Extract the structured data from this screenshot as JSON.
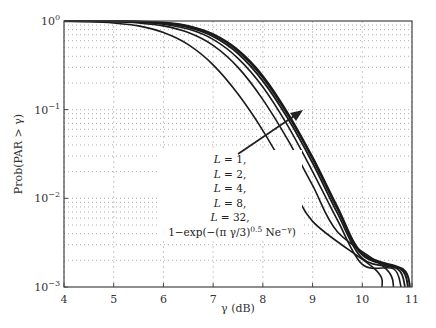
{
  "chart_data": {
    "type": "line",
    "title": "",
    "xlabel": "γ (dB)",
    "ylabel": "Prob(PAR > γ)",
    "xlim": [
      4,
      11
    ],
    "ylim": [
      0.001,
      1
    ],
    "yscale": "log",
    "grid": true,
    "x_ticks": [
      "4",
      "5",
      "6",
      "7",
      "8",
      "9",
      "10",
      "11"
    ],
    "y_ticks": [
      {
        "base": "10",
        "exp": "0"
      },
      {
        "base": "10",
        "exp": "−1"
      },
      {
        "base": "10",
        "exp": "−2"
      },
      {
        "base": "10",
        "exp": "−3"
      }
    ],
    "legend": [
      "L = 1,",
      "L = 2,",
      "L = 4,",
      "L = 8,",
      "L = 32,",
      "1−exp(−(π γ/3)^0.5 Ne^−γ)"
    ],
    "legend_position": "center-left (inside plot)",
    "annotation": "arrow pointing up-right indicating increasing L",
    "x": [
      4.0,
      4.5,
      5.0,
      5.5,
      6.0,
      6.5,
      7.0,
      7.5,
      8.0,
      8.5,
      9.0,
      9.5,
      10.0,
      10.5,
      11.0
    ],
    "series": [
      {
        "name": "L = 1",
        "values": [
          0.99,
          0.98,
          0.95,
          0.88,
          0.74,
          0.54,
          0.32,
          0.15,
          0.058,
          0.019,
          0.0055,
          0.0016,
          0.0012,
          0.0007,
          null
        ]
      },
      {
        "name": "L = 2",
        "values": [
          1.0,
          0.99,
          0.98,
          0.95,
          0.88,
          0.74,
          0.53,
          0.3,
          0.13,
          0.046,
          0.014,
          0.0042,
          0.0016,
          0.0008,
          null
        ]
      },
      {
        "name": "L = 4",
        "values": [
          1.0,
          1.0,
          0.99,
          0.97,
          0.92,
          0.81,
          0.62,
          0.38,
          0.18,
          0.066,
          0.02,
          0.0057,
          0.0018,
          0.00095,
          null
        ]
      },
      {
        "name": "L = 8",
        "values": [
          1.0,
          1.0,
          0.99,
          0.98,
          0.94,
          0.85,
          0.67,
          0.43,
          0.21,
          0.08,
          0.025,
          0.0068,
          0.0021,
          0.001,
          null
        ]
      },
      {
        "name": "L = 32",
        "values": [
          1.0,
          1.0,
          1.0,
          0.98,
          0.95,
          0.87,
          0.7,
          0.46,
          0.23,
          0.088,
          0.028,
          0.0076,
          0.0023,
          0.0011,
          null
        ]
      },
      {
        "name": "1−exp(−(π γ/3)^0.5 Ne^−γ)",
        "values": [
          1.0,
          1.0,
          1.0,
          0.99,
          0.96,
          0.88,
          0.71,
          0.47,
          0.24,
          0.092,
          0.029,
          0.008,
          0.0024,
          0.0012,
          null
        ]
      }
    ]
  },
  "axes": {
    "xlabel": "γ (dB)",
    "ylabel": "Prob(PAR > γ)"
  }
}
